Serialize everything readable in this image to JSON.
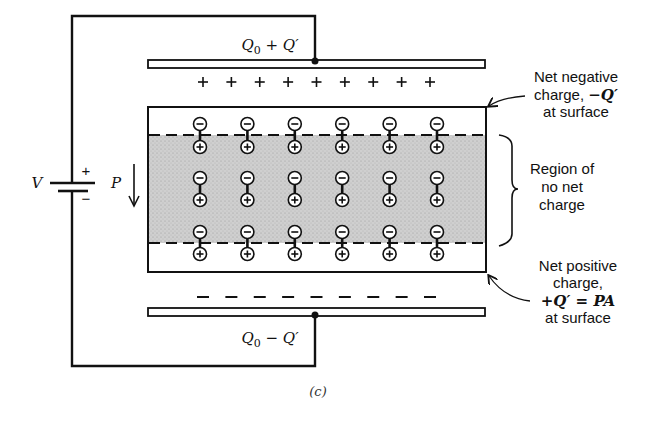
{
  "figure": {
    "caption": "(c)",
    "top_plate_label": {
      "q": "Q",
      "sub": "0",
      "op": " + ",
      "qp": "Q′"
    },
    "bottom_plate_label": {
      "q": "Q",
      "sub": "0",
      "op": " − ",
      "qp": "Q′"
    },
    "battery": {
      "label": "V",
      "plus": "+",
      "minus": "−"
    },
    "polarization": {
      "label": "P",
      "icon": "down-arrow-icon"
    },
    "top_surface_charges": {
      "symbol": "+",
      "count": 9
    },
    "bottom_surface_charges": {
      "symbol": "−",
      "count": 9
    },
    "dipoles": {
      "columns": 6,
      "rows": 3,
      "negative_symbol": "⊖",
      "positive_symbol": "⊕"
    },
    "annotations": {
      "net_negative": {
        "line1": "Net negative",
        "line2_prefix": "charge, ",
        "line2_math": "−Q′",
        "line3": "at surface"
      },
      "no_net_region": {
        "line1": "Region of",
        "line2": "no net",
        "line3": "charge"
      },
      "net_positive": {
        "line1": "Net positive",
        "line2": "charge,",
        "line3_math": "+Q′ = PA",
        "line4": "at surface"
      }
    },
    "colors": {
      "ink": "#111111",
      "shaded_region": "#c9c9c9",
      "background": "#ffffff"
    }
  }
}
